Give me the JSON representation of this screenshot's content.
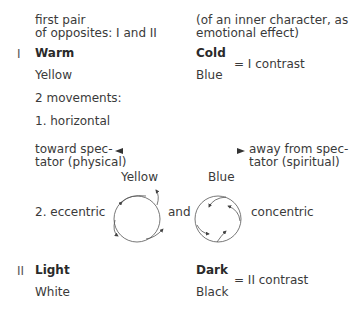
{
  "header": {
    "left": [
      "first pair",
      "of opposites: I and II"
    ],
    "right": [
      "(of an inner character, as",
      "emotional effect)"
    ]
  },
  "section1": {
    "numeral": "I",
    "left_title": "Warm",
    "left_color": "Yellow",
    "right_title": "Cold",
    "right_color": "Blue",
    "contrast": "= I contrast",
    "movements_label": "2 movements:",
    "horizontal_label": "1. horizontal",
    "toward": [
      "toward spec-",
      "tator (physical)"
    ],
    "away": [
      "away from spec-",
      "tator (spiritual)"
    ],
    "eccentric_label": "2.  eccentric",
    "circle1_label": "Yellow",
    "circle2_label": "Blue",
    "and_label": "and",
    "concentric_label": "concentric"
  },
  "section2": {
    "numeral": "II",
    "left_title": "Light",
    "left_color": "White",
    "right_title": "Dark",
    "right_color": "Black",
    "contrast": "= II contrast"
  }
}
